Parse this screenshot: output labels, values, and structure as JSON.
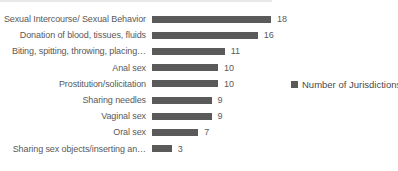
{
  "chart_data": {
    "type": "bar",
    "orientation": "horizontal",
    "title": "",
    "xlabel": "",
    "ylabel": "",
    "categories": [
      "Sexual Intercourse/ Sexual Behavior",
      "Donation of blood, tissues, fluids",
      "Biting, spitting, throwing, placing…",
      "Anal sex",
      "Prostitution/solicitation",
      "Sharing needles",
      "Vaginal sex",
      "Oral sex",
      "Sharing sex objects/inserting an…"
    ],
    "values": [
      18,
      16,
      11,
      10,
      10,
      9,
      9,
      7,
      3
    ],
    "series_name": "Number of Jurisdictions",
    "value_labels_shown": true,
    "xlim": [
      0,
      18
    ],
    "grid": false,
    "axes_shown": false,
    "legend_position": "right",
    "bar_color": "#5a5a5a",
    "text_color": "#595959",
    "background": "#ffffff"
  }
}
